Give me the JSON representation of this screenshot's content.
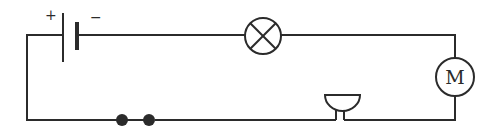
{
  "diagram": {
    "type": "circuit",
    "components": [
      {
        "id": "battery",
        "kind": "battery",
        "positive_label": "+",
        "negative_label": "−"
      },
      {
        "id": "lamp",
        "kind": "lamp"
      },
      {
        "id": "motor",
        "kind": "motor",
        "label": "M"
      },
      {
        "id": "bell",
        "kind": "electric-bell"
      },
      {
        "id": "switch",
        "kind": "open-switch"
      }
    ],
    "colors": {
      "line": "#2b2b2b",
      "background": "#ffffff"
    }
  }
}
